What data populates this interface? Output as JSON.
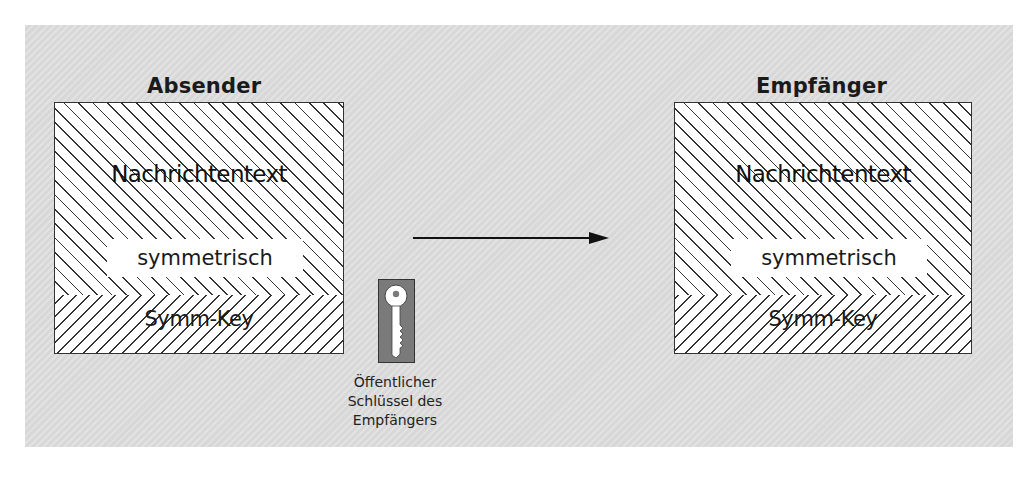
{
  "diagram": {
    "type": "hybrid-encryption-flow",
    "sender": {
      "title": "Absender",
      "message_label": "Nachrichtentext",
      "encryption_label": "symmetrisch",
      "key_label": "Symm-Key"
    },
    "receiver": {
      "title": "Empfänger",
      "message_label": "Nachrichtentext",
      "encryption_label": "symmetrisch",
      "key_label": "Symm-Key"
    },
    "key": {
      "icon": "key-icon",
      "caption_lines": [
        "Öffentlicher",
        "Schlüssel des",
        "Empfängers"
      ]
    },
    "arrow": {
      "from": "sender",
      "to": "receiver",
      "icon": "arrow-right-icon"
    },
    "colors": {
      "panel_background": "#dcdcdc",
      "box_fill": "#ffffff",
      "hatch_line": "#333333",
      "key_background": "#7a7a7a",
      "key_fill": "#ffffff"
    }
  }
}
